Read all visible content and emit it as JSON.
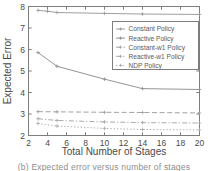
{
  "figure": {
    "caption": "(b) Expected error versus number of stages",
    "background": "#ffffff",
    "frame_color": "#7d7d7d",
    "text_color": "#4a4a4a"
  },
  "chart_data": {
    "type": "line",
    "title": "",
    "xlabel": "Total Number of Stages",
    "ylabel": "Expected Error",
    "xlim": [
      2,
      20
    ],
    "ylim": [
      2,
      8
    ],
    "xticks": [
      2,
      4,
      6,
      8,
      10,
      12,
      14,
      16,
      18,
      20
    ],
    "yticks": [
      2,
      3,
      4,
      5,
      6,
      7,
      8
    ],
    "grid": false,
    "legend_position": "upper-right-inside",
    "series": [
      {
        "name": "Constant Policy",
        "style": "solid",
        "color": "#9a9a9a",
        "marker": "cross",
        "x": [
          3,
          4,
          5,
          10,
          14,
          20
        ],
        "y": [
          7.82,
          7.78,
          7.72,
          7.68,
          7.65,
          7.63
        ]
      },
      {
        "name": "Reactive Policy",
        "style": "solid",
        "color": "#8e8e8e",
        "marker": "cross",
        "x": [
          3,
          5,
          10,
          14,
          20
        ],
        "y": [
          5.86,
          5.22,
          4.62,
          4.18,
          4.14
        ]
      },
      {
        "name": "Constant-w1 Policy",
        "style": "dashed",
        "color": "#9d9d9d",
        "marker": "cross",
        "x": [
          3,
          5,
          10,
          14,
          20
        ],
        "y": [
          3.11,
          3.1,
          3.08,
          3.07,
          3.05
        ]
      },
      {
        "name": "Reactive-w1 Policy",
        "style": "dashdot",
        "color": "#a5a5a5",
        "marker": "cross",
        "x": [
          3,
          5,
          10,
          14,
          20
        ],
        "y": [
          2.78,
          2.7,
          2.63,
          2.6,
          2.58
        ]
      },
      {
        "name": "NDP Policy",
        "style": "dotted",
        "color": "#a8a8a8",
        "marker": "cross",
        "x": [
          3,
          5,
          10,
          14,
          20
        ],
        "y": [
          2.56,
          2.44,
          2.33,
          2.28,
          2.26
        ]
      }
    ]
  },
  "legend": {
    "entries": [
      {
        "label": "Constant Policy"
      },
      {
        "label": "Reactive Policy"
      },
      {
        "label": "Constant-w1 Policy"
      },
      {
        "label": "Reactive-w1 Policy"
      },
      {
        "label": "NDP Policy"
      }
    ]
  }
}
